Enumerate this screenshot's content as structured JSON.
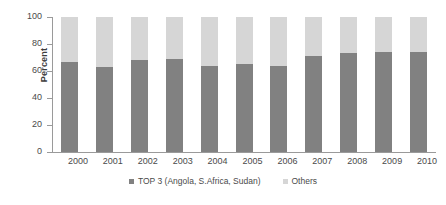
{
  "chart_data": {
    "type": "bar",
    "subtype": "stacked-percent",
    "title": "",
    "xlabel": "",
    "ylabel": "Percent",
    "ylim": [
      0,
      100
    ],
    "yticks": [
      0,
      20,
      40,
      60,
      80,
      100
    ],
    "grid": false,
    "legend_position": "bottom",
    "categories": [
      "2000",
      "2001",
      "2002",
      "2003",
      "2004",
      "2005",
      "2006",
      "2007",
      "2008",
      "2009",
      "2010"
    ],
    "series": [
      {
        "name": "TOP 3 (Angola, S.Africa, Sudan)",
        "color": "#818181",
        "values": [
          67,
          63,
          68,
          69,
          64,
          65,
          64,
          71,
          73,
          74,
          74
        ]
      },
      {
        "name": "Others",
        "color": "#d6d6d6",
        "values": [
          33,
          37,
          32,
          31,
          36,
          35,
          36,
          29,
          27,
          26,
          26
        ]
      }
    ]
  },
  "colors": {
    "top3": "#818181",
    "others": "#d6d6d6",
    "axis": "#9a9a9a",
    "text": "#4a4a4a",
    "background": "#ffffff"
  },
  "axis": {
    "y_title": "Percent"
  },
  "legend": {
    "items": [
      {
        "label": "TOP 3 (Angola, S.Africa, Sudan)",
        "swatch": "top3"
      },
      {
        "label": "Others",
        "swatch": "others"
      }
    ]
  }
}
